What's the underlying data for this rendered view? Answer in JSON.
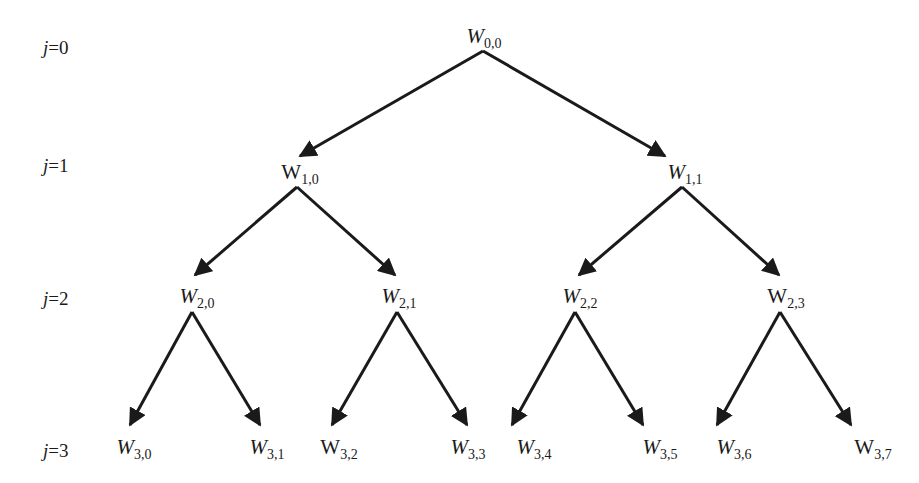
{
  "diagram": {
    "type": "binary-tree",
    "levels": [
      {
        "label_var": "j",
        "label_val": "=0"
      },
      {
        "label_var": "j",
        "label_val": "=1"
      },
      {
        "label_var": "j",
        "label_val": "=2"
      },
      {
        "label_var": "j",
        "label_val": "=3"
      }
    ],
    "nodes": [
      {
        "id": "W0,0",
        "base": "W",
        "sub": "0,0",
        "italic": true
      },
      {
        "id": "W1,0",
        "base": "W",
        "sub": "1,0",
        "italic": false
      },
      {
        "id": "W1,1",
        "base": "W",
        "sub": "1,1",
        "italic": true
      },
      {
        "id": "W2,0",
        "base": "W",
        "sub": "2,0",
        "italic": true
      },
      {
        "id": "W2,1",
        "base": "W",
        "sub": "2,1",
        "italic": true
      },
      {
        "id": "W2,2",
        "base": "W",
        "sub": "2,2",
        "italic": true
      },
      {
        "id": "W2,3",
        "base": "W",
        "sub": "2,3",
        "italic": false
      },
      {
        "id": "W3,0",
        "base": "W",
        "sub": "3,0",
        "italic": true
      },
      {
        "id": "W3,1",
        "base": "W",
        "sub": "3,1",
        "italic": true
      },
      {
        "id": "W3,2",
        "base": "W",
        "sub": "3,2",
        "italic": false
      },
      {
        "id": "W3,3",
        "base": "W",
        "sub": "3,3",
        "italic": true
      },
      {
        "id": "W3,4",
        "base": "W",
        "sub": "3,4",
        "italic": true
      },
      {
        "id": "W3,5",
        "base": "W",
        "sub": "3,5",
        "italic": true
      },
      {
        "id": "W3,6",
        "base": "W",
        "sub": "3,6",
        "italic": true
      },
      {
        "id": "W3,7",
        "base": "W",
        "sub": "3,7",
        "italic": false
      }
    ],
    "edges": [
      [
        "W0,0",
        "W1,0"
      ],
      [
        "W0,0",
        "W1,1"
      ],
      [
        "W1,0",
        "W2,0"
      ],
      [
        "W1,0",
        "W2,1"
      ],
      [
        "W1,1",
        "W2,2"
      ],
      [
        "W1,1",
        "W2,3"
      ],
      [
        "W2,0",
        "W3,0"
      ],
      [
        "W2,0",
        "W3,1"
      ],
      [
        "W2,1",
        "W3,2"
      ],
      [
        "W2,1",
        "W3,3"
      ],
      [
        "W2,2",
        "W3,4"
      ],
      [
        "W2,2",
        "W3,5"
      ],
      [
        "W2,3",
        "W3,6"
      ],
      [
        "W2,3",
        "W3,7"
      ]
    ],
    "colors": {
      "line": "#1a1a1a",
      "text": "#1a1a1a",
      "background": "#ffffff"
    }
  }
}
